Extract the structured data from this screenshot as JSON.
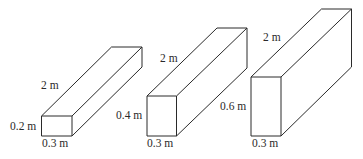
{
  "diagram": {
    "boxes": [
      {
        "length": "2 m",
        "height": "0.2 m",
        "width": "0.3 m"
      },
      {
        "length": "2 m",
        "height": "0.4 m",
        "width": "0.3 m"
      },
      {
        "length": "2 m",
        "height": "0.6 m",
        "width": "0.3 m"
      }
    ],
    "stroke_color": "#2a2a2a"
  }
}
